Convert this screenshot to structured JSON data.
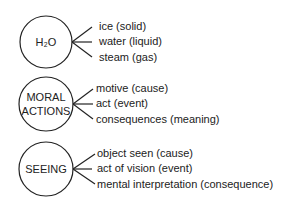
{
  "diagram": {
    "groups": [
      {
        "node": "H₂O",
        "node_lines": [
          "H₂O"
        ],
        "branches": [
          "ice (solid)",
          "water (liquid)",
          "steam (gas)"
        ]
      },
      {
        "node": "MORAL ACTIONS",
        "node_lines": [
          "MORAL",
          "ACTIONS"
        ],
        "branches": [
          "motive (cause)",
          "act (event)",
          "consequences (meaning)"
        ]
      },
      {
        "node": "SEEING",
        "node_lines": [
          "SEEING"
        ],
        "branches": [
          "object seen (cause)",
          "act of vision (event)",
          "mental interpretation (consequence)"
        ]
      }
    ]
  }
}
